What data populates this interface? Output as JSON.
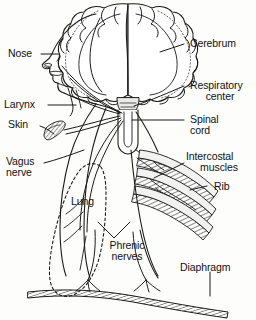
{
  "figure": {
    "type": "anatomical-diagram",
    "background_color": "#fdfdfb",
    "ink_color": "#1a1a1a"
  },
  "labels": {
    "nose": "Nose",
    "larynx": "Larynx",
    "skin": "Skin",
    "vagus_nerve_line1": "Vagus",
    "vagus_nerve_line2": "nerve",
    "lung": "Lung",
    "phrenic_line1": "Phrenic",
    "phrenic_line2": "nerves",
    "cerebrum": "Cerebrum",
    "respiratory_line1": "Respiratory",
    "respiratory_line2": "center",
    "spinal_line1": "Spinal",
    "spinal_line2": "cord",
    "intercostal_line1": "Intercostal",
    "intercostal_line2": "muscles",
    "rib": "Rib",
    "diaphragm": "Diaphragm"
  },
  "structures": [
    {
      "name": "cerebrum",
      "description": "coronal brain section with gyri"
    },
    {
      "name": "respiratory-center",
      "description": "brainstem medulla region"
    },
    {
      "name": "spinal-cord",
      "description": "vertical cord below brainstem"
    },
    {
      "name": "head-profile",
      "description": "lateral face outline with nose and mouth"
    },
    {
      "name": "larynx",
      "description": "throat airway structure"
    },
    {
      "name": "skin",
      "description": "hatched skin patch receptor"
    },
    {
      "name": "vagus-nerve",
      "description": "nerve running to lung"
    },
    {
      "name": "lung",
      "description": "dashed lung outline"
    },
    {
      "name": "ribs",
      "description": "three curved ribs"
    },
    {
      "name": "intercostal-muscles",
      "description": "hatched bands between ribs"
    },
    {
      "name": "phrenic-nerves",
      "description": "paired nerves to diaphragm"
    },
    {
      "name": "diaphragm",
      "description": "hatched dome arc at base"
    }
  ]
}
